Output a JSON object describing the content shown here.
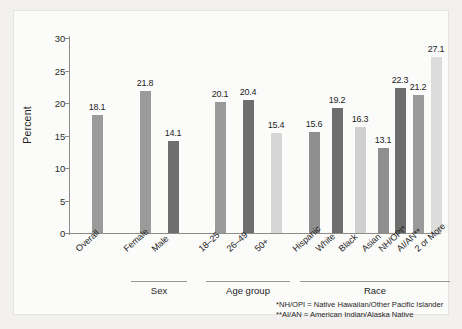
{
  "chart_data": {
    "type": "bar",
    "title": "",
    "subtitle": "",
    "xlabel": "",
    "ylabel": "Percent",
    "ylim": [
      0,
      30
    ],
    "ytick_step": 5,
    "yticks": [
      "0",
      "5",
      "10",
      "15",
      "20",
      "25",
      "30"
    ],
    "grid": false,
    "legend": "none",
    "categories": [
      "Overall",
      "Female",
      "Male",
      "18–25",
      "26–49",
      "50+",
      "Hispanic",
      "White",
      "Black",
      "Asian",
      "NH/OPI*",
      "AI/AN**",
      "2 or More"
    ],
    "values": [
      18.1,
      21.8,
      14.1,
      20.1,
      20.4,
      15.4,
      15.6,
      19.2,
      16.3,
      13.1,
      22.3,
      21.2,
      27.1
    ],
    "value_labels": [
      "18.1",
      "21.8",
      "14.1",
      "20.1",
      "20.4",
      "15.4",
      "15.6",
      "19.2",
      "16.3",
      "13.1",
      "22.3",
      "21.2",
      "27.1"
    ],
    "bar_colors": [
      "#9a9a9a",
      "#9a9a9a",
      "#6e6e6e",
      "#9a9a9a",
      "#6e6e6e",
      "#d6d6d6",
      "#8f8f8f",
      "#6e6e6e",
      "#d0d0d0",
      "#8f8f8f",
      "#6e6e6e",
      "#9a9a9a",
      "#dcdcdc"
    ],
    "groups": [
      {
        "label": "Sex",
        "start_index": 1,
        "end_index": 2
      },
      {
        "label": "Age group",
        "start_index": 3,
        "end_index": 5
      },
      {
        "label": "Race",
        "start_index": 6,
        "end_index": 12
      }
    ],
    "footnotes": [
      "*NH/OPI = Native Hawaiian/Other Pacific Islander",
      "**AI/AN = American Indian/Alaska Native"
    ]
  }
}
